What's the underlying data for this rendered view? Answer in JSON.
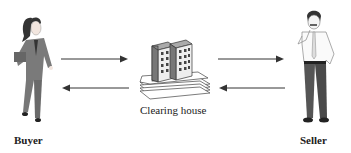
{
  "diagram": {
    "nodes": {
      "buyer": {
        "label": "Buyer",
        "icon": "businesswoman-icon"
      },
      "clearing_house": {
        "label": "Clearing house",
        "icon": "office-buildings-icon"
      },
      "seller": {
        "label": "Seller",
        "icon": "businessman-icon"
      }
    },
    "edges": [
      {
        "from": "buyer",
        "to": "clearing_house"
      },
      {
        "from": "clearing_house",
        "to": "buyer"
      },
      {
        "from": "clearing_house",
        "to": "seller"
      },
      {
        "from": "seller",
        "to": "clearing_house"
      }
    ],
    "colors": {
      "arrow": "#333333",
      "figure_dark": "#555555",
      "figure_mid": "#888888"
    }
  }
}
